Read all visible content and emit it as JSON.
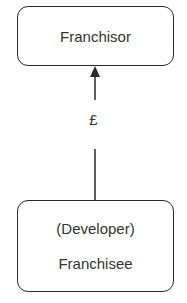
{
  "diagram": {
    "top_node": {
      "label": "Franchisor"
    },
    "edge": {
      "label": "£",
      "direction": "bottom-to-top"
    },
    "bottom_node": {
      "line1": "(Developer)",
      "line2": "Franchisee"
    }
  },
  "colors": {
    "stroke": "#2a2a2a",
    "text": "#333333",
    "background": "#ffffff"
  }
}
